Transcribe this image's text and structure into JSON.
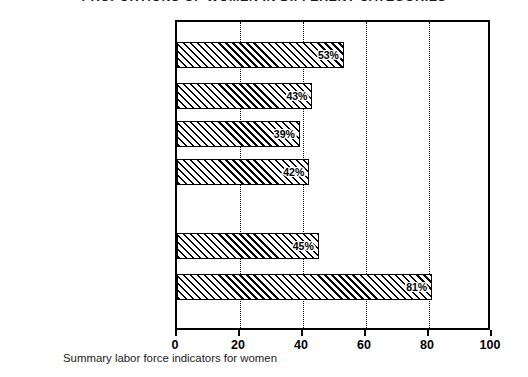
{
  "chart_data": {
    "type": "bar",
    "orientation": "horizontal",
    "title": "PROPORTIONS OF WOMEN IN DIFFERENT CATEGORIES",
    "caption": "Summary labor force indicators for women",
    "xlabel": "",
    "ylabel": "",
    "xlim": [
      0,
      100
    ],
    "grid": true,
    "legend": false,
    "unit": "%",
    "xticks": [
      0,
      20,
      40,
      60,
      80,
      100
    ],
    "xtick_labels": [
      "0",
      "20",
      "40",
      "60",
      "80",
      "100"
    ],
    "gridlines": [
      20,
      40,
      60,
      80
    ],
    "categories": [
      "The civilian noninstitutional\npopulation 16 years and over",
      "The employed",
      "Persons employed full time",
      "The unemployed",
      "Professional workers",
      "Clerical workers"
    ],
    "values": [
      53,
      43,
      39,
      42,
      45,
      81
    ],
    "bar_labels": [
      "53%",
      "43%",
      "39%",
      "42%",
      "45%",
      "81%"
    ],
    "group_gap_after_index": 3,
    "bar_style": {
      "fill": "diagonal-hatch",
      "hatch_color": "#000000",
      "background": "#ffffff",
      "edge_color": "#000000"
    }
  },
  "bars": [
    {
      "label": "The civilian noninstitutional\npopulation 16 years and over",
      "value": 53,
      "value_label": "53%",
      "top": 40,
      "label_top": 41
    },
    {
      "label": "The employed",
      "value": 43,
      "value_label": "43%",
      "top": 81,
      "label_top": 82
    },
    {
      "label": "Persons employed full time",
      "value": 39,
      "value_label": "39%",
      "top": 119,
      "label_top": 120
    },
    {
      "label": "The unemployed",
      "value": 42,
      "value_label": "42%",
      "top": 157,
      "label_top": 158
    },
    {
      "label": "Professional workers",
      "value": 45,
      "value_label": "45%",
      "top": 231,
      "label_top": 232
    },
    {
      "label": "Clerical workers",
      "value": 81,
      "value_label": "81%",
      "top": 272,
      "label_top": 273
    }
  ],
  "axis": {
    "ticks": [
      {
        "value": 0,
        "label": "0"
      },
      {
        "value": 20,
        "label": "20"
      },
      {
        "value": 40,
        "label": "40"
      },
      {
        "value": 60,
        "label": "60"
      },
      {
        "value": 80,
        "label": "80"
      },
      {
        "value": 100,
        "label": "100"
      }
    ]
  },
  "colors": {
    "ink": "#000000",
    "text": "#1b1b1b",
    "background": "#ffffff"
  }
}
